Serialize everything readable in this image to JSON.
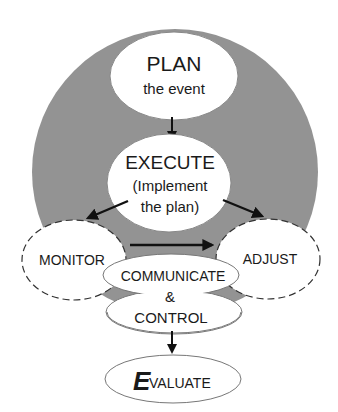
{
  "diagram": {
    "colors": {
      "background_circle": "#939393",
      "node_fill": "#ffffff",
      "stroke": "#555555",
      "arrow": "#111111",
      "text": "#1a1a1a"
    },
    "nodes": {
      "plan": {
        "title": "PLAN",
        "subtitle": "the event"
      },
      "execute": {
        "title": "EXECUTE",
        "line2": "(Implement",
        "line3": "the plan)"
      },
      "monitor": {
        "title": "MONITOR",
        "border": "dashed"
      },
      "adjust": {
        "title": "ADJUST",
        "border": "dashed"
      },
      "communicate": {
        "line1": "COMMUNICATE",
        "line2": "&",
        "line3": "CONTROL"
      },
      "evaluate": {
        "initial": "E",
        "rest": "VALUATE"
      }
    },
    "edges": [
      {
        "from": "plan",
        "to": "execute"
      },
      {
        "from": "execute",
        "to": "monitor"
      },
      {
        "from": "execute",
        "to": "adjust"
      },
      {
        "from": "monitor",
        "to": "adjust"
      },
      {
        "from": "communicate",
        "to": "evaluate"
      }
    ]
  }
}
